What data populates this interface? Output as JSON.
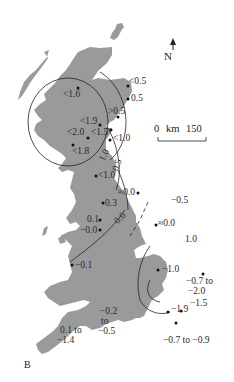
{
  "map": {
    "panel_label": "B",
    "north_arrow": {
      "icon": "north-arrow-icon",
      "label": "N"
    },
    "scale_bar": {
      "start": "0",
      "unit": "km",
      "end": "150"
    },
    "land_color": "#9a9a9a",
    "contour_color": "#222222",
    "point_labels": {
      "scot_ne1": "<0.5",
      "scot_ne2": "0.5",
      "scot_e": ">0.5",
      "scot_nw": "<1.6",
      "scot_c1": "<1.9",
      "scot_c2": "<1.5",
      "scot_w": "<2.0",
      "scot_forth": "<1.0",
      "scot_sw": "<1.8",
      "eng_nw": "<1.0",
      "eng_ne": "≈0.0",
      "eng_lanc": "0.3",
      "eng_mersey1": "0.1",
      "eng_mersey2": "−0.0",
      "eng_humber1": "−0.5",
      "eng_humber2": "≈0.0",
      "eng_wash_line": "1.0",
      "eng_fen": "−1.0",
      "wales": "−0.1",
      "ea_1": "−0.7 to",
      "ea_2": "−2.0",
      "thames_1": "−1.5",
      "thames_2": "−1.9",
      "south": "−0.7 to −0.9",
      "severn_1": "−0.2",
      "severn_2": "to",
      "severn_3": "−0.5",
      "sw_1": "0.1 to",
      "sw_2": "−1.4"
    },
    "contour_labels": {
      "c1": "1.0",
      "c2": "0.5",
      "c3": "0.0"
    }
  }
}
